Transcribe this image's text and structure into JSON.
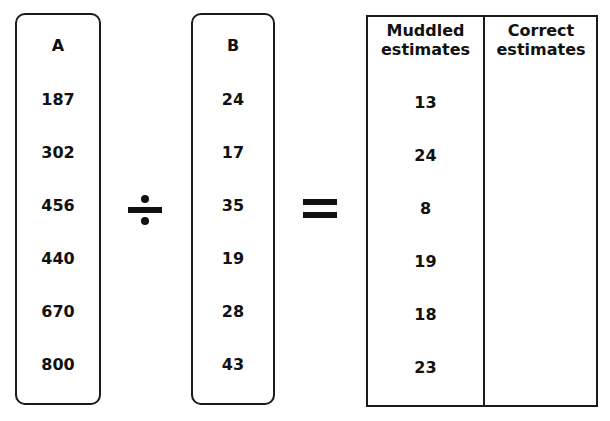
{
  "column_a": {
    "header": "A",
    "values": [
      "187",
      "302",
      "456",
      "440",
      "670",
      "800"
    ]
  },
  "operator_divide": {
    "icon": "division-sign-icon",
    "symbol": "÷"
  },
  "column_b": {
    "header": "B",
    "values": [
      "24",
      "17",
      "35",
      "19",
      "28",
      "43"
    ]
  },
  "operator_equals": {
    "icon": "equals-sign-icon",
    "symbol": "="
  },
  "results_table": {
    "headers": {
      "muddled_line1": "Muddled",
      "muddled_line2": "estimates",
      "correct_line1": "Correct",
      "correct_line2": "estimates"
    },
    "muddled_estimates": [
      "13",
      "24",
      "8",
      "19",
      "18",
      "23"
    ],
    "correct_estimates": [
      "",
      "",
      "",
      "",
      "",
      ""
    ]
  }
}
